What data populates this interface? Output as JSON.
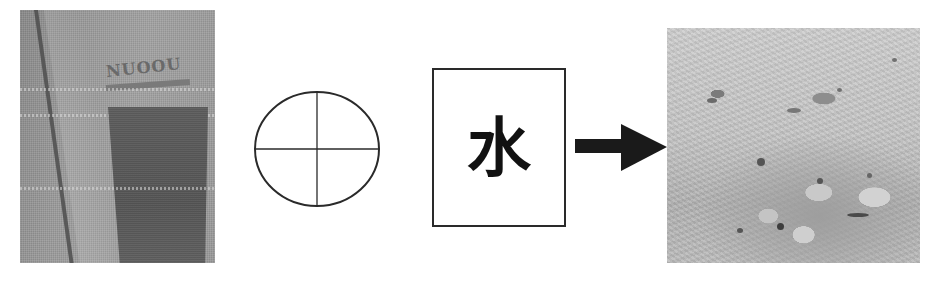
{
  "diagram": {
    "steps": [
      {
        "id": "bag",
        "kind": "photo",
        "label_on_bag": "NUOOU"
      },
      {
        "id": "mix-symbol",
        "kind": "circle-crosshair"
      },
      {
        "id": "water",
        "kind": "text-box",
        "text": "水"
      },
      {
        "id": "arrow",
        "kind": "arrow",
        "direction": "right"
      },
      {
        "id": "soil",
        "kind": "photo"
      }
    ],
    "colors": {
      "stroke": "#2a2a2a",
      "arrow": "#1a1a1a",
      "background": "#ffffff"
    }
  }
}
